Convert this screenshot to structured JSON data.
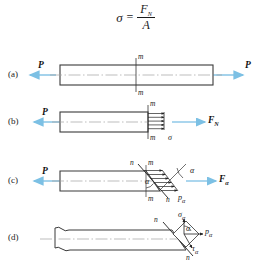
{
  "figure": {
    "title_equation": {
      "lhs": "σ",
      "operator": "=",
      "numerator": "F",
      "numerator_sub": "N",
      "denominator": "A"
    },
    "panels": [
      {
        "key": "(a)",
        "description": "Straight bar in axial tension with section m-m",
        "labels": {
          "left_force": "P",
          "right_force": "P",
          "section_top": "m",
          "section_bottom": "m"
        }
      },
      {
        "key": "(b)",
        "description": "Free body cut at transverse section m-m showing uniform normal stress sigma and resultant internal force F_N",
        "labels": {
          "left_force": "P",
          "right_force": "F",
          "right_force_sub": "N",
          "section_top": "m",
          "section_bottom": "m",
          "stress": "σ"
        }
      },
      {
        "key": "(c)",
        "description": "Free body cut at inclined section n-n at angle alpha showing total stress p_alpha and resultant F_alpha",
        "labels": {
          "left_force": "P",
          "right_force": "F",
          "right_force_sub": "α",
          "section_m_top": "m",
          "section_m_bottom": "m",
          "section_n_top": "n",
          "section_n_bottom": "n",
          "angle_outer": "α",
          "angle_inner": "α",
          "total_stress": "p",
          "total_stress_sub": "α"
        }
      },
      {
        "key": "(d)",
        "description": "Detail of inclined plane n-n with total stress p_alpha decomposed into normal stress sigma_alpha and shear stress tau_alpha",
        "labels": {
          "section_n_top": "n",
          "section_n_bottom": "n",
          "normal_stress": "σ",
          "normal_stress_sub": "α",
          "total_stress": "p",
          "total_stress_sub": "α",
          "shear_stress": "τ",
          "shear_stress_sub": "α",
          "angle": "α"
        }
      }
    ],
    "colors": {
      "force_arrow": "#8fc9e8",
      "bar_outline": "#3a3a3a",
      "centerline": "#9a9a9a",
      "stress_arrow": "#222222",
      "text": "#1a1a1a",
      "background": "#ffffff"
    }
  }
}
